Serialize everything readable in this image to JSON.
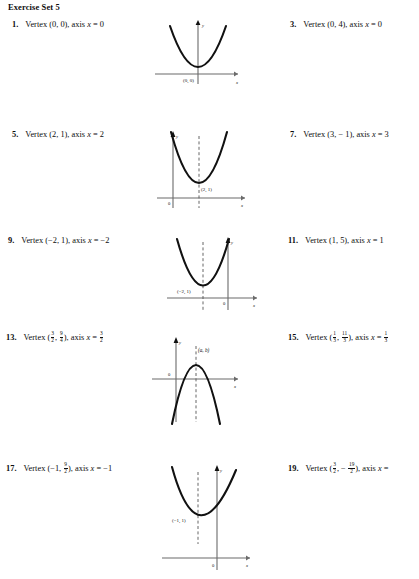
{
  "header": {
    "title": "Exercise Set 5"
  },
  "exercises": [
    {
      "num": "1.",
      "prefix": "Vertex (0, 0), axis ",
      "var": "x",
      "eq": " = 0"
    },
    {
      "num": "3.",
      "prefix": "Vertex (0, 4), axis ",
      "var": "x",
      "eq": " = 0"
    },
    {
      "num": "5.",
      "prefix": "Vertex (2, 1), axis ",
      "var": "x",
      "eq": " = 2"
    },
    {
      "num": "7.",
      "prefix": "Vertex (3, − 1), axis ",
      "var": "x",
      "eq": " = 3"
    },
    {
      "num": "9.",
      "prefix": "Vertex (−2, 1), axis ",
      "var": "x",
      "eq": " = −2"
    },
    {
      "num": "11.",
      "prefix": "Vertex (1, 5), axis ",
      "var": "x",
      "eq": " = 1"
    },
    {
      "num": "13.",
      "prefix": "Vertex (",
      "var": "x",
      "eq": " = ",
      "fracs": {
        "a_n": "3",
        "a_d": "2",
        "b_n": "9",
        "b_d": "4",
        "ax_n": "3",
        "ax_d": "2"
      },
      "mid": ", ",
      "post": "), axis "
    },
    {
      "num": "15.",
      "prefix": "Vertex (",
      "var": "x",
      "eq": " = ",
      "fracs": {
        "a_n": "1",
        "a_d": "3",
        "b_n": "11",
        "b_d": "3",
        "ax_n": "1",
        "ax_d": "3"
      },
      "mid": ", ",
      "post": "), axis "
    },
    {
      "num": "17.",
      "prefix": "Vertex (−1, ",
      "var": "x",
      "eq": " = −1",
      "fracs": {
        "b_n": "9",
        "b_d": "2"
      },
      "post": "), axis "
    },
    {
      "num": "19.",
      "prefix": "Vertex (",
      "var": "x",
      "eq": " = ",
      "fracs": {
        "a_n": "3",
        "a_d": "2",
        "b_n": "19",
        "b_d": "2",
        "ax_n": "3",
        "ax_d": "2"
      },
      "mid": ", − ",
      "post": "), axis "
    }
  ],
  "graphs": [
    {
      "id": "graph-1",
      "vertex_label": "(0, 0)",
      "origin_label": "",
      "x_label": "x",
      "y_label": "y",
      "direction": "up",
      "dashed_axis": false
    },
    {
      "id": "graph-5",
      "vertex_label": "(2, 1)",
      "origin_label": "0",
      "x_label": "x",
      "y_label": "y",
      "direction": "up",
      "dashed_axis": true
    },
    {
      "id": "graph-9",
      "vertex_label": "(−2, 1)",
      "origin_label": "0",
      "x_label": "x",
      "y_label": "y",
      "direction": "up",
      "dashed_axis": true
    },
    {
      "id": "graph-13",
      "vertex_label": "(a, b)",
      "origin_label": "0",
      "x_label": "x",
      "y_label": "y",
      "direction": "down",
      "dashed_axis": true
    },
    {
      "id": "graph-17",
      "vertex_label": "(−1, 1)",
      "origin_label": "0",
      "x_label": "x",
      "y_label": "y",
      "direction": "up",
      "dashed_axis": true
    }
  ],
  "colors": {
    "ink": "#0d0d0d",
    "axis": "#6b6b6b",
    "curve": "#111111"
  }
}
